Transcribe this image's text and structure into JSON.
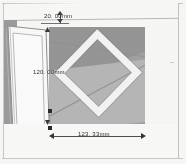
{
  "document": {
    "title": "Panel elevation with diamond inlay",
    "units": "mm"
  },
  "colors": {
    "page_background": "#fbfbfa",
    "panel_base": "#9c9c9c",
    "panel_shade_dark": "#949494",
    "panel_shade_light": "#b6b6b6",
    "diamond_band": "#f7f7f5",
    "door_white": "#fdfdfc",
    "gutter_gray": "#9a9a9a",
    "dimension_line": "#3a3a3a",
    "dimension_text": "#2b2b2b"
  },
  "dimensions": [
    {
      "id": "top-gap",
      "label": "20. 00mm",
      "value": 20.0,
      "unit": "mm",
      "orientation": "vertical",
      "position": "top"
    },
    {
      "id": "panel-height",
      "label": "120. 00mm",
      "value": 120.0,
      "unit": "mm",
      "orientation": "vertical",
      "position": "left"
    },
    {
      "id": "panel-width",
      "label": "123. 33mm",
      "value": 123.33,
      "unit": "mm",
      "orientation": "horizontal",
      "position": "bottom"
    }
  ],
  "geometry": {
    "panel_name": "wall-panel-face",
    "diamond_name": "diamond-inlay",
    "door_name": "door-leaf",
    "floor_name": "floor-strip"
  },
  "right_edge": {
    "mark": "ا"
  }
}
